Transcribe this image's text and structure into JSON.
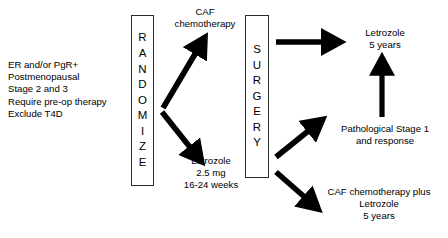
{
  "diagram": {
    "type": "clinical-trial-schema",
    "stroke_color": "#000000",
    "box_border_color": "#2c2c2c",
    "background_color": "#ffffff",
    "eligibility": {
      "criteria": [
        "ER and/or PgR+",
        "Postmenopausal",
        "Stage 2 and 3",
        "Require pre-op therapy",
        "Exclude T4D"
      ]
    },
    "randomize_box": {
      "label": "RANDOMIZE",
      "letters": [
        "R",
        "A",
        "N",
        "D",
        "O",
        "M",
        "I",
        "Z",
        "E"
      ]
    },
    "surgery_box": {
      "label": "SURGERY",
      "letters": [
        "S",
        "U",
        "R",
        "G",
        "E",
        "R",
        "Y"
      ]
    },
    "arms": {
      "upper_arm": {
        "lines": [
          "CAF",
          "chemotherapy"
        ]
      },
      "lower_arm": {
        "lines": [
          "Letrozole",
          "2.5 mg",
          "16-24 weeks"
        ]
      }
    },
    "outcomes": {
      "letrozole_five_years": {
        "lines": [
          "Letrozole",
          "5 years"
        ]
      },
      "pathological_stage": {
        "lines": [
          "Pathological Stage 1",
          "and response"
        ]
      },
      "caf_plus_letrozole": {
        "lines": [
          "CAF chemotherapy plus",
          "Letrozole",
          "5 years"
        ]
      }
    },
    "arrows": [
      {
        "name": "randomize-to-caf-chemo",
        "direction": "up-right"
      },
      {
        "name": "randomize-to-letrozole",
        "direction": "down-right"
      },
      {
        "name": "surgery-to-letrozole-5-years",
        "direction": "right"
      },
      {
        "name": "surgery-to-pathological-stage",
        "direction": "up-right"
      },
      {
        "name": "surgery-to-caf-plus-letrozole",
        "direction": "down-right"
      },
      {
        "name": "pathological-stage-to-letrozole-5-years",
        "direction": "up"
      }
    ]
  }
}
